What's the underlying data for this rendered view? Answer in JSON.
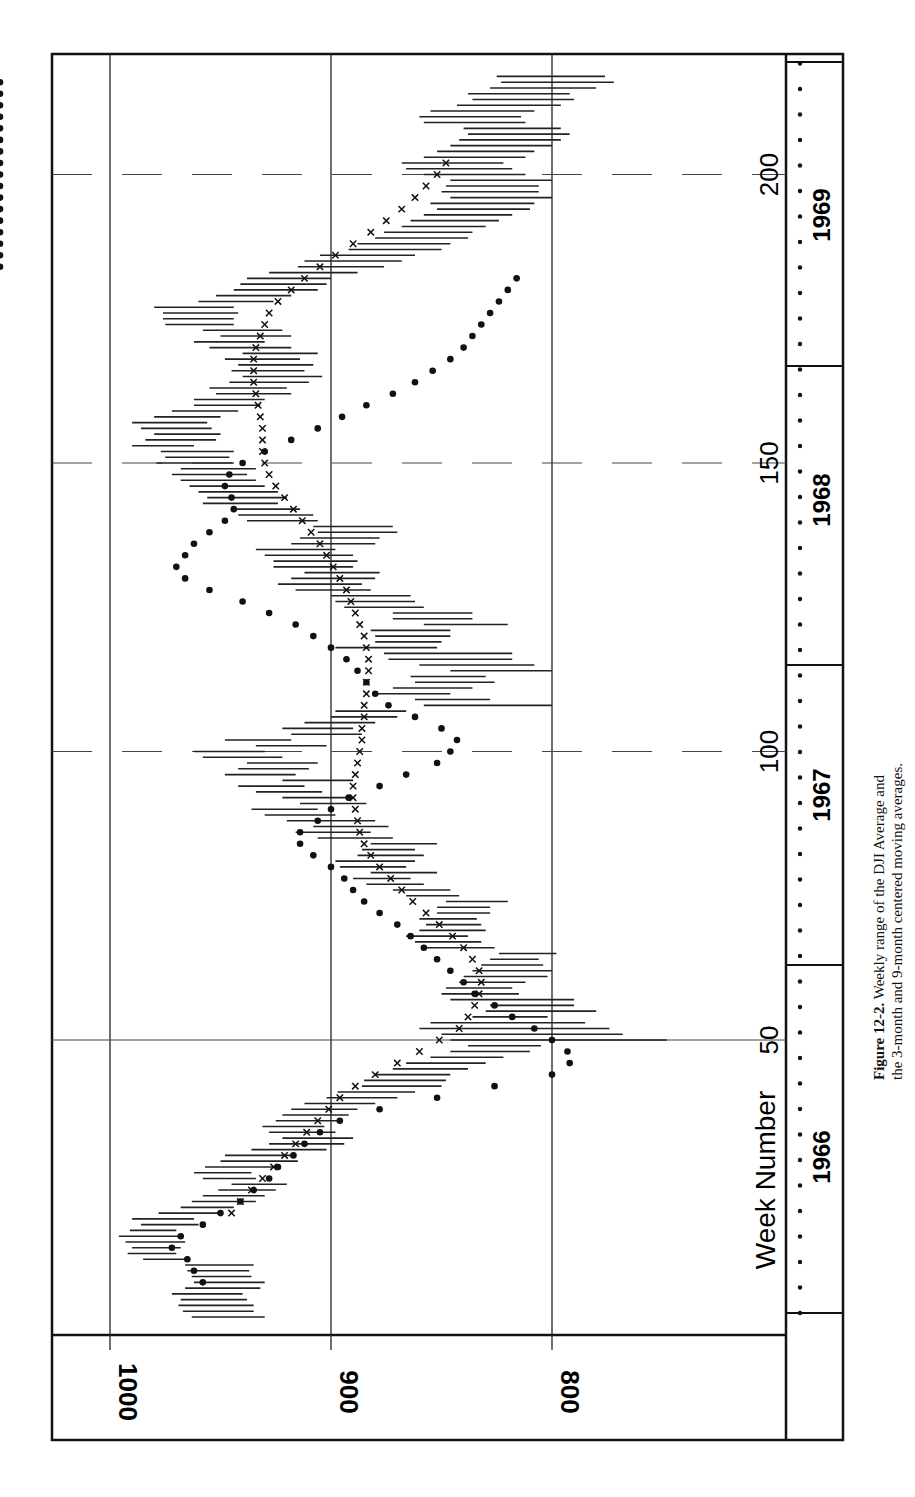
{
  "page": {
    "caption": {
      "figure_label": "Figure 12-2.",
      "line1_rest": "Weekly range of the DJI Average and",
      "line2": "the 3-month and 9-month centered moving averages."
    }
  },
  "chart_data": {
    "type": "range-line",
    "title": "Weekly range of the DJI Average and the 3-month and 9-month centered moving averages",
    "orientation": "rotated 90° counterclockwise (week axis vertical, value axis horizontal)",
    "xlabel": "Week Number",
    "ylabel": "",
    "x_ticks": [
      50,
      100,
      150,
      200
    ],
    "y_ticks": [
      1000,
      900,
      800
    ],
    "ylim": [
      740,
      1000
    ],
    "xlim": [
      1,
      225
    ],
    "grid": true,
    "years": [
      {
        "label": "1966",
        "start_week": 1,
        "end_week": 56
      },
      {
        "label": "1967",
        "start_week": 57,
        "end_week": 108
      },
      {
        "label": "1968",
        "start_week": 109,
        "end_week": 160
      },
      {
        "label": "1969",
        "start_week": 161,
        "end_week": 213
      }
    ],
    "legend": [
      {
        "marker": "line",
        "name": "Weekly range (high-low)"
      },
      {
        "marker": "dot",
        "name": "3-month centered moving average"
      },
      {
        "marker": "x",
        "name": "9-month centered moving average"
      }
    ],
    "weekly_range": {
      "weeks": [
        2,
        3,
        4,
        5,
        6,
        7,
        8,
        9,
        10,
        11,
        12,
        13,
        14,
        15,
        16,
        17,
        18,
        19,
        20,
        21,
        22,
        23,
        24,
        25,
        26,
        27,
        28,
        29,
        30,
        31,
        32,
        33,
        34,
        35,
        36,
        37,
        38,
        39,
        40,
        41,
        42,
        43,
        44,
        45,
        46,
        47,
        48,
        49,
        50,
        51,
        52,
        53,
        54,
        55,
        56,
        57,
        58,
        59,
        60,
        61,
        62,
        63,
        64,
        65,
        66,
        67,
        68,
        69,
        70,
        71,
        72,
        73,
        74,
        75,
        76,
        77,
        78,
        79,
        80,
        81,
        82,
        83,
        84,
        85,
        86,
        87,
        88,
        89,
        90,
        91,
        92,
        93,
        94,
        95,
        96,
        97,
        98,
        99,
        100,
        101,
        102,
        103,
        104,
        105,
        106,
        107,
        108,
        109,
        110,
        111,
        112,
        113,
        114,
        115,
        116,
        117,
        118,
        119,
        120,
        121,
        122,
        123,
        124,
        125,
        126,
        127,
        128,
        129,
        130,
        131,
        132,
        133,
        134,
        135,
        136,
        137,
        138,
        139,
        140,
        141,
        142,
        143,
        144,
        145,
        146,
        147,
        148,
        149,
        150,
        151,
        152,
        153,
        154,
        155,
        156,
        157,
        158,
        159,
        160,
        161,
        162,
        163,
        164,
        165,
        166,
        167,
        168,
        169,
        170,
        171,
        172,
        173,
        174,
        175,
        176,
        177,
        178,
        179,
        180,
        181,
        182,
        183,
        184,
        185,
        186,
        187,
        188,
        189,
        190,
        191,
        192,
        193,
        194,
        195,
        196,
        197,
        198,
        199,
        200,
        201,
        202,
        203,
        204,
        205,
        206,
        207,
        208,
        209,
        210,
        211,
        212,
        213,
        214,
        215,
        216,
        217,
        218,
        219,
        220
      ],
      "high": [
        963,
        967,
        969,
        968,
        972,
        966,
        962,
        963,
        965,
        966,
        985,
        992,
        990,
        993,
        996,
        991,
        986,
        990,
        978,
        968,
        963,
        958,
        951,
        945,
        958,
        962,
        957,
        950,
        948,
        936,
        928,
        922,
        928,
        931,
        925,
        922,
        918,
        912,
        902,
        897,
        886,
        885,
        880,
        872,
        866,
        855,
        846,
        838,
        846,
        850,
        860,
        855,
        836,
        830,
        828,
        846,
        850,
        848,
        842,
        840,
        836,
        832,
        828,
        824,
        858,
        862,
        866,
        860,
        857,
        860,
        852,
        852,
        848,
        866,
        872,
        884,
        890,
        882,
        896,
        898,
        888,
        886,
        882,
        906,
        916,
        908,
        920,
        930,
        936,
        914,
        922,
        934,
        942,
        922,
        948,
        942,
        938,
        958,
        962,
        934,
        948,
        918,
        922,
        912,
        900,
        898,
        858,
        862,
        880,
        872,
        862,
        864,
        846,
        860,
        874,
        876,
        898,
        880,
        880,
        882,
        858,
        872,
        872,
        894,
        898,
        900,
        916,
        924,
        918,
        912,
        926,
        926,
        930,
        934,
        918,
        914,
        906,
        908,
        938,
        942,
        944,
        958,
        956,
        960,
        964,
        968,
        972,
        968,
        979,
        975,
        977,
        990,
        984,
        980,
        986,
        990,
        980,
        972,
        962,
        962,
        952,
        955,
        946,
        940,
        945,
        942,
        948,
        940,
        955,
        962,
        950,
        958,
        975,
        976,
        976,
        980,
        960,
        952,
        944,
        941,
        938,
        928,
        915,
        912,
        905,
        892,
        888,
        880,
        876,
        868,
        864,
        858,
        852,
        855,
        846,
        850,
        848,
        846,
        858,
        866,
        868,
        858,
        852,
        846,
        842,
        838,
        840,
        858,
        860,
        855,
        843,
        836,
        838,
        828,
        823,
        825
      ],
      "low": [
        930,
        935,
        935,
        938,
        940,
        932,
        930,
        936,
        937,
        935,
        965,
        970,
        968,
        966,
        968,
        970,
        960,
        962,
        950,
        944,
        934,
        930,
        925,
        920,
        934,
        936,
        925,
        915,
        916,
        902,
        894,
        890,
        898,
        903,
        897,
        892,
        888,
        880,
        870,
        862,
        850,
        848,
        846,
        838,
        830,
        822,
        810,
        805,
        748,
        768,
        774,
        785,
        802,
        780,
        790,
        790,
        815,
        818,
        812,
        802,
        800,
        804,
        806,
        798,
        826,
        832,
        838,
        830,
        832,
        834,
        828,
        828,
        820,
        842,
        846,
        858,
        864,
        852,
        866,
        862,
        858,
        862,
        852,
        872,
        882,
        874,
        880,
        898,
        906,
        884,
        890,
        904,
        912,
        890,
        916,
        910,
        906,
        922,
        930,
        902,
        918,
        886,
        890,
        880,
        870,
        866,
        800,
        828,
        846,
        836,
        826,
        830,
        800,
        808,
        818,
        818,
        852,
        850,
        846,
        846,
        820,
        836,
        836,
        858,
        862,
        864,
        882,
        886,
        880,
        878,
        890,
        888,
        890,
        898,
        880,
        878,
        870,
        872,
        906,
        908,
        914,
        924,
        920,
        924,
        930,
        934,
        938,
        934,
        944,
        946,
        944,
        962,
        952,
        950,
        954,
        956,
        950,
        942,
        932,
        930,
        918,
        920,
        910,
        904,
        912,
        908,
        914,
        906,
        918,
        930,
        918,
        922,
        944,
        944,
        942,
        944,
        926,
        918,
        906,
        902,
        900,
        888,
        876,
        868,
        862,
        850,
        846,
        838,
        836,
        830,
        824,
        818,
        810,
        808,
        800,
        806,
        806,
        800,
        812,
        818,
        822,
        812,
        808,
        800,
        796,
        792,
        796,
        812,
        814,
        808,
        796,
        790,
        792,
        780,
        772,
        776
      ]
    },
    "ma_3month": {
      "weeks": [
        8,
        9,
        10,
        11,
        12,
        13,
        14,
        15,
        16,
        17,
        18,
        19,
        20,
        21,
        22,
        23,
        24,
        25,
        26,
        27,
        28,
        29,
        30,
        31,
        32,
        33,
        34,
        35,
        36,
        37,
        38,
        39,
        40,
        41,
        42,
        43,
        44,
        45,
        46,
        47,
        48,
        49,
        50,
        51,
        52,
        53,
        54,
        55,
        56,
        57,
        58,
        59,
        60,
        61,
        62,
        63,
        64,
        65,
        66,
        67,
        68,
        69,
        70,
        71,
        72,
        73,
        74,
        75,
        76,
        77,
        78,
        79,
        80,
        81,
        82,
        83,
        84,
        85,
        86,
        87,
        88,
        89,
        90,
        91,
        92,
        93,
        94,
        95,
        96,
        97,
        98,
        99,
        100,
        101,
        102,
        103,
        104,
        105,
        106,
        107,
        108,
        109,
        110,
        111,
        112,
        113,
        114,
        115,
        116,
        117,
        118,
        119,
        120,
        121,
        122,
        123,
        124,
        125,
        126,
        127,
        128,
        129,
        130,
        131,
        132,
        133,
        134,
        135,
        136,
        137,
        138,
        139,
        140,
        141,
        142,
        143,
        144,
        145,
        146,
        147,
        148,
        149,
        150,
        151,
        152,
        153,
        154,
        155,
        156,
        157,
        158,
        159,
        160,
        161,
        162,
        163,
        164,
        165,
        166,
        167,
        168,
        169,
        170,
        171,
        172,
        173,
        174,
        175,
        176,
        177,
        178,
        179,
        180,
        181,
        182,
        183,
        184,
        185,
        186,
        187,
        188,
        189,
        190,
        191,
        192,
        193,
        194,
        195,
        196,
        197,
        198,
        199,
        200,
        201,
        202,
        203,
        204,
        205,
        206,
        207,
        208,
        209,
        210,
        211,
        212,
        213,
        214,
        215,
        216
      ],
      "values": [
        958,
        960,
        962,
        963,
        965,
        970,
        972,
        971,
        968,
        962,
        958,
        953,
        950,
        946,
        941,
        938,
        935,
        930,
        928,
        926,
        924,
        920,
        917,
        915,
        912,
        909,
        905,
        902,
        896,
        890,
        878,
        866,
        852,
        840,
        826,
        813,
        800,
        795,
        792,
        792,
        793,
        795,
        800,
        804,
        808,
        814,
        818,
        822,
        826,
        830,
        835,
        838,
        840,
        843,
        846,
        850,
        852,
        855,
        858,
        862,
        864,
        867,
        870,
        874,
        878,
        882,
        885,
        888,
        890,
        892,
        894,
        897,
        900,
        904,
        908,
        910,
        914,
        916,
        914,
        910,
        906,
        903,
        900,
        896,
        892,
        886,
        878,
        872,
        866,
        858,
        852,
        848,
        846,
        844,
        843,
        846,
        850,
        856,
        862,
        868,
        874,
        878,
        880,
        882,
        884,
        886,
        888,
        890,
        893,
        896,
        900,
        904,
        908,
        912,
        916,
        922,
        928,
        934,
        940,
        948,
        955,
        962,
        966,
        968,
        970,
        968,
        966,
        964,
        962,
        958,
        955,
        952,
        948,
        945,
        944,
        944,
        945,
        946,
        948,
        947,
        946,
        944,
        940,
        935,
        930,
        924,
        918,
        912,
        906,
        900,
        895,
        890,
        884,
        878,
        872,
        866,
        862,
        858,
        854,
        850,
        846,
        842,
        840,
        838,
        836,
        834,
        832,
        830,
        828,
        826,
        824,
        822,
        820,
        818,
        816,
        814
      ],
      "note": "Dots plotted roughly every week; values approximate"
    },
    "ma_9month": {
      "weeks": [
        20,
        22,
        24,
        26,
        28,
        30,
        32,
        34,
        36,
        38,
        40,
        42,
        44,
        46,
        48,
        50,
        52,
        54,
        56,
        58,
        60,
        62,
        64,
        66,
        68,
        70,
        72,
        74,
        76,
        78,
        80,
        82,
        84,
        86,
        88,
        90,
        92,
        94,
        96,
        98,
        100,
        102,
        104,
        106,
        108,
        110,
        112,
        114,
        116,
        118,
        120,
        122,
        124,
        126,
        128,
        130,
        132,
        134,
        136,
        138,
        140,
        142,
        144,
        146,
        148,
        150,
        152,
        154,
        156,
        158,
        160,
        162,
        164,
        166,
        168,
        170,
        172,
        174,
        176,
        178,
        180,
        182,
        184,
        186,
        188,
        190,
        192,
        194,
        196,
        198,
        200,
        202
      ],
      "values": [
        945,
        941,
        936,
        931,
        926,
        921,
        916,
        911,
        906,
        901,
        896,
        889,
        880,
        870,
        860,
        851,
        842,
        838,
        835,
        833,
        832,
        833,
        836,
        840,
        845,
        851,
        857,
        863,
        868,
        873,
        878,
        882,
        885,
        887,
        888,
        889,
        890,
        890,
        889,
        888,
        887,
        886,
        886,
        885,
        885,
        884,
        884,
        883,
        883,
        884,
        885,
        887,
        889,
        891,
        893,
        896,
        899,
        902,
        905,
        909,
        913,
        917,
        921,
        925,
        928,
        930,
        931,
        931,
        931,
        932,
        933,
        934,
        935,
        935,
        935,
        934,
        932,
        930,
        928,
        924,
        918,
        912,
        905,
        898,
        890,
        882,
        875,
        868,
        862,
        857,
        852,
        848
      ]
    }
  }
}
